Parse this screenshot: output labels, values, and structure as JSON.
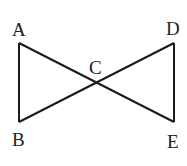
{
  "diagram": {
    "type": "geometry",
    "stroke_color": "#1a1a1a",
    "points": {
      "A": {
        "label": "A",
        "x": 19,
        "y": 43
      },
      "B": {
        "label": "B",
        "x": 19,
        "y": 122
      },
      "C": {
        "label": "C",
        "x": 96,
        "y": 83
      },
      "D": {
        "label": "D",
        "x": 174,
        "y": 43
      },
      "E": {
        "label": "E",
        "x": 174,
        "y": 122
      }
    },
    "segments": [
      [
        "A",
        "B"
      ],
      [
        "A",
        "E"
      ],
      [
        "B",
        "D"
      ],
      [
        "D",
        "E"
      ]
    ]
  }
}
